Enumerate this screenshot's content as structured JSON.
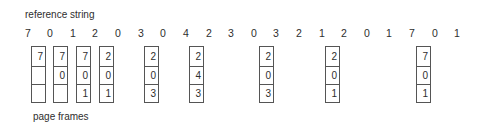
{
  "title": "reference string",
  "footer_label": "page frames",
  "reference_string": [
    "7",
    "0",
    "1",
    "2",
    "0",
    "3",
    "0",
    "4",
    "2",
    "3",
    "0",
    "3",
    "2",
    "1",
    "2",
    "0",
    "1",
    "7",
    "0",
    "1"
  ],
  "reference_x": [
    28,
    50,
    73,
    95,
    118,
    141,
    163,
    186,
    209,
    231,
    254,
    276,
    299,
    322,
    344,
    367,
    389,
    412,
    435,
    457
  ],
  "frames": [
    {
      "ref_index": 0,
      "x": 31,
      "cells": [
        "7",
        "",
        ""
      ]
    },
    {
      "ref_index": 1,
      "x": 53,
      "cells": [
        "7",
        "0",
        ""
      ]
    },
    {
      "ref_index": 2,
      "x": 76,
      "cells": [
        "7",
        "0",
        "1"
      ]
    },
    {
      "ref_index": 3,
      "x": 99,
      "cells": [
        "2",
        "0",
        "1"
      ]
    },
    {
      "ref_index": 5,
      "x": 144,
      "cells": [
        "2",
        "0",
        "3"
      ]
    },
    {
      "ref_index": 7,
      "x": 189,
      "cells": [
        "2",
        "4",
        "3"
      ]
    },
    {
      "ref_index": 10,
      "x": 259,
      "cells": [
        "2",
        "0",
        "3"
      ]
    },
    {
      "ref_index": 13,
      "x": 325,
      "cells": [
        "2",
        "0",
        "1"
      ]
    },
    {
      "ref_index": 17,
      "x": 416,
      "cells": [
        "7",
        "0",
        "1"
      ]
    }
  ]
}
